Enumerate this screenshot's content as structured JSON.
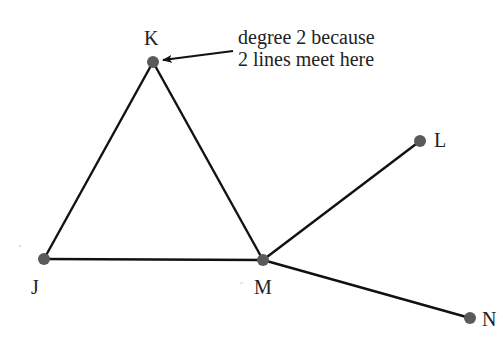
{
  "diagram": {
    "type": "graph",
    "colors": {
      "edge": "#111111",
      "node": "#5a5a5a",
      "text": "#222222"
    },
    "nodes": [
      {
        "id": "K",
        "label": "K",
        "x": 153,
        "y": 62
      },
      {
        "id": "L",
        "label": "L",
        "x": 420,
        "y": 141
      },
      {
        "id": "J",
        "label": "J",
        "x": 44,
        "y": 259
      },
      {
        "id": "M",
        "label": "M",
        "x": 263,
        "y": 260
      },
      {
        "id": "N",
        "label": "N",
        "x": 470,
        "y": 318
      }
    ],
    "edges": [
      {
        "from": "K",
        "to": "J"
      },
      {
        "from": "K",
        "to": "M"
      },
      {
        "from": "J",
        "to": "M"
      },
      {
        "from": "M",
        "to": "L"
      },
      {
        "from": "M",
        "to": "N"
      }
    ],
    "annotation": {
      "line1": "degree 2 because",
      "line2": "2 lines meet here",
      "points_to": "K"
    }
  }
}
